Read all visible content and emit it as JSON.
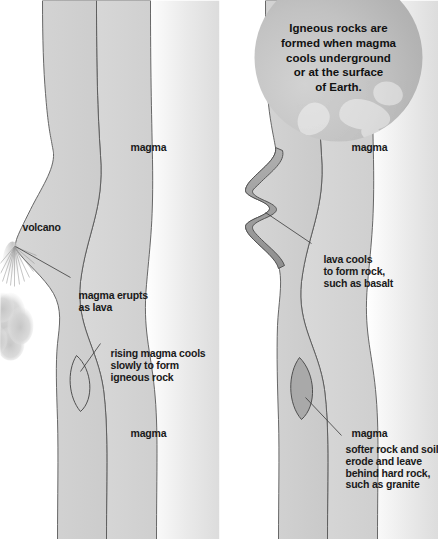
{
  "diagram": {
    "title_text": "Igneous rock formation cross-sections",
    "callout": {
      "text": "Igneous rocks are\nformed when magma\ncools underground\nor at the surface\nof Earth."
    },
    "panel_top": {
      "labels": {
        "volcano": "volcano",
        "erupts": "magma erupts\nas lava",
        "rising": "rising magma cools\nslowly to form\nigneous rock",
        "magma_left": "magma",
        "magma_right": "magma"
      }
    },
    "panel_bottom": {
      "labels": {
        "lava_cools": "lava cools\nto form rock,\nsuch as basalt",
        "softer_rock": "softer rock and soil\nerode and leave\nbehind hard rock,\nsuch as granite",
        "magma_left": "magma",
        "magma_right": "magma"
      }
    },
    "colors": {
      "background": "#ffffff",
      "crust_light": "#d8d8d8",
      "mantle_mid": "#c9c9c9",
      "deep_light": "#ececec",
      "basalt_dark": "#9a9a9a",
      "granite_fill": "#a9a9a9",
      "outline": "#4a4a4a",
      "text": "#1a1a1a",
      "ash_cloud": "#cfcfcf",
      "globe": "#c2c2c2"
    }
  }
}
